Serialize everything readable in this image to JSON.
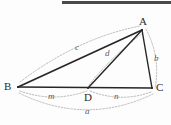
{
  "figure": {
    "background_color": "#fdfdfd",
    "topbar": {
      "name": "top-dark-band",
      "color": "#4a4a4a",
      "x": 62,
      "y": 1,
      "width": 109,
      "height": 3
    },
    "stroke_colors": {
      "solid_edge": "#262626",
      "dotted_arc": "#a9a9a9",
      "vertex_text": "#2b2b2b",
      "segment_text": "#5d5d5d"
    },
    "vertices": [
      {
        "id": "A",
        "label": "A",
        "x": 142,
        "y": 30,
        "label_x": 139,
        "label_y": 16
      },
      {
        "id": "B",
        "label": "B",
        "x": 18,
        "y": 87,
        "label_x": 4,
        "label_y": 81
      },
      {
        "id": "C",
        "label": "C",
        "x": 152,
        "y": 88,
        "label_x": 156,
        "label_y": 82
      },
      {
        "id": "D",
        "label": "D",
        "x": 88,
        "y": 88,
        "label_x": 84,
        "label_y": 92
      }
    ],
    "solid_segments": [
      {
        "name": "segment-AB",
        "from": "B",
        "to": "A",
        "x1": 18,
        "y1": 87,
        "x2": 142,
        "y2": 30
      },
      {
        "name": "segment-AC",
        "from": "A",
        "to": "C",
        "x1": 142,
        "y1": 30,
        "x2": 152,
        "y2": 88
      },
      {
        "name": "segment-BC",
        "from": "B",
        "to": "C",
        "x1": 18,
        "y1": 87,
        "x2": 152,
        "y2": 88
      },
      {
        "name": "segment-AD",
        "from": "A",
        "to": "D",
        "x1": 142,
        "y1": 30,
        "x2": 88,
        "y2": 88
      }
    ],
    "dotted_arcs": [
      {
        "name": "arc-c",
        "label": "c",
        "measures": "AB",
        "path": "M 20 82 Q 78 38 140 26",
        "label_x": 75,
        "label_y": 43
      },
      {
        "name": "arc-d",
        "label": "d",
        "measures": "AD",
        "path": "M 143 33 Q 112 56 89 85",
        "label_x": 105,
        "label_y": 49
      },
      {
        "name": "arc-b",
        "label": "b",
        "measures": "AC",
        "path": "M 146 29 Q 161 58 155 88",
        "label_x": 154,
        "label_y": 54
      },
      {
        "name": "arc-m",
        "label": "m",
        "measures": "BD",
        "path": "M 20 91 Q 53 103 87 91",
        "label_x": 48,
        "label_y": 92
      },
      {
        "name": "arc-n",
        "label": "n",
        "measures": "DC",
        "path": "M 90 91 Q 121 103 151 92",
        "label_x": 114,
        "label_y": 92
      },
      {
        "name": "arc-a",
        "label": "a",
        "measures": "BC",
        "path": "M 19 93 Q 86 126 153 94",
        "label_x": 85,
        "label_y": 107
      }
    ]
  }
}
